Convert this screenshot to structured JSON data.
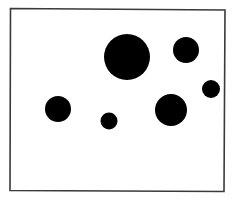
{
  "diagram": {
    "type": "dot-field",
    "canvas": {
      "width": 235,
      "height": 203,
      "background": "#ffffff"
    },
    "frame": {
      "points": [
        [
          10.5,
          8.5
        ],
        [
          225,
          10
        ],
        [
          224,
          191.5
        ],
        [
          10,
          190.5
        ]
      ],
      "stroke": "#3a3a3a",
      "stroke_width": 1.6
    },
    "dot_color": "#000000",
    "dots": [
      {
        "id": "dot-large-top-center",
        "cx": 127,
        "cy": 57,
        "r": 23
      },
      {
        "id": "dot-top-right",
        "cx": 186,
        "cy": 50,
        "r": 13
      },
      {
        "id": "dot-right-edge-small",
        "cx": 211,
        "cy": 89,
        "r": 9
      },
      {
        "id": "dot-lower-right",
        "cx": 171,
        "cy": 110,
        "r": 16
      },
      {
        "id": "dot-left",
        "cx": 58,
        "cy": 109,
        "r": 13
      },
      {
        "id": "dot-bottom-small",
        "cx": 109,
        "cy": 121,
        "r": 8.5
      }
    ]
  }
}
